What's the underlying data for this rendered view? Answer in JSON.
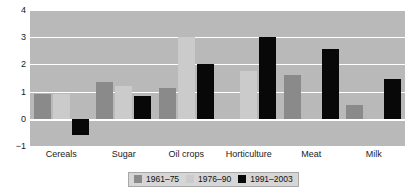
{
  "chart_data": {
    "type": "bar",
    "title": "",
    "subtitle": "",
    "xlabel": "",
    "ylabel": "",
    "ylim": [
      -1,
      4
    ],
    "yticks": [
      -1,
      0,
      1,
      2,
      3,
      4
    ],
    "ytick_labels": [
      "−1",
      "0",
      "1",
      "2",
      "3",
      "4"
    ],
    "grid": true,
    "legend_position": "bottom",
    "categories": [
      "Cereals",
      "Sugar",
      "Oil crops",
      "Horticulture",
      "Meat",
      "Milk"
    ],
    "series": [
      {
        "name": "1961–75",
        "color": "#8a8a8a",
        "values": [
          0.9,
          1.35,
          1.15,
          0.0,
          1.6,
          0.5
        ]
      },
      {
        "name": "1976–90",
        "color": "#cbcbcb",
        "values": [
          0.9,
          1.2,
          3.0,
          1.75,
          0.0,
          0.0
        ]
      },
      {
        "name": "1991–2003",
        "color": "#080808",
        "values": [
          -0.6,
          0.85,
          2.0,
          3.0,
          2.55,
          1.45
        ]
      }
    ]
  },
  "colors": {
    "plot_background": "#b9b9b9",
    "page_background": "#ffffff",
    "gridline": "#ffffff",
    "text": "#1a1a1a",
    "legend_background": "#d6d6d6",
    "legend_border": "#a8a8a8"
  }
}
